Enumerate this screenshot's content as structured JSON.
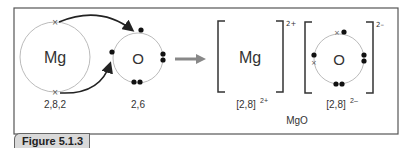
{
  "figure": {
    "caption": "Figure 5.1.3",
    "atoms": {
      "mg": {
        "symbol": "Mg",
        "config": "2,8,2"
      },
      "o": {
        "symbol": "O",
        "config": "2,6"
      }
    },
    "ions": {
      "mg": {
        "symbol": "Mg",
        "charge": "2+",
        "config": "[2,8]",
        "config_charge": "2+"
      },
      "o": {
        "symbol": "O",
        "charge": "2–",
        "config": "[2,8]",
        "config_charge": "2–"
      }
    },
    "compound": "MgO",
    "colors": {
      "frame": "#555555",
      "circle": "#bbbbbb",
      "arrow": "#888888",
      "caption_bg": "#d9d9d9"
    }
  }
}
